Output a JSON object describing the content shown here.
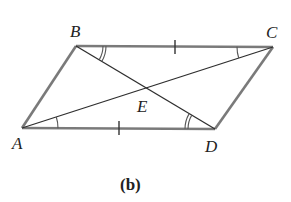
{
  "figure": {
    "caption": "(b)",
    "shape": "parallelogram ABCD with diagonals AC and BD intersecting at E",
    "colors": {
      "edge": "#7a7a7a",
      "diagonal": "#2e2e2e",
      "text": "#222222",
      "background": "#ffffff"
    }
  },
  "vertices": {
    "A": {
      "label": "A",
      "x": 22,
      "y": 128
    },
    "B": {
      "label": "B",
      "x": 76,
      "y": 46
    },
    "C": {
      "label": "C",
      "x": 273,
      "y": 47
    },
    "D": {
      "label": "D",
      "x": 215,
      "y": 129
    },
    "E": {
      "label": "E",
      "x": 148,
      "y": 88
    }
  },
  "sides": [
    {
      "name": "AB",
      "marks": 0
    },
    {
      "name": "BC",
      "marks": 1
    },
    {
      "name": "CD",
      "marks": 0
    },
    {
      "name": "DA",
      "marks": 1
    }
  ],
  "diagonals": [
    "AC",
    "BD"
  ],
  "angle_marks": [
    {
      "vertex": "B",
      "between": [
        "BC",
        "BD"
      ],
      "arcs": 2
    },
    {
      "vertex": "D",
      "between": [
        "DA",
        "DB"
      ],
      "arcs": 2
    },
    {
      "vertex": "A",
      "between": [
        "AD",
        "AC"
      ],
      "arcs": 1
    },
    {
      "vertex": "C",
      "between": [
        "CB",
        "CA"
      ],
      "arcs": 1
    }
  ]
}
